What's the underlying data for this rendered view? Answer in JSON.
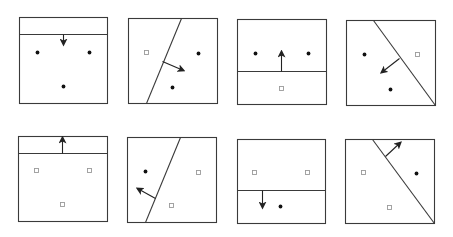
{
  "figure": {
    "width": 453,
    "height": 237,
    "colors": {
      "frame": "#3a3a3a",
      "line": "#3a3a3a",
      "arrow": "#222222",
      "dot": "#111111",
      "square_stroke": "#9a9a9a",
      "background": "#ffffff"
    },
    "panels": [
      {
        "id": "top-1",
        "box": [
          19,
          17,
          107,
          103
        ],
        "boundary": [
          [
            19,
            34
          ],
          [
            107,
            34
          ]
        ],
        "arrow": [
          [
            63,
            34
          ],
          [
            63,
            44
          ]
        ],
        "dots": [
          [
            37,
            52
          ],
          [
            89,
            52
          ],
          [
            63,
            86
          ]
        ],
        "squares": []
      },
      {
        "id": "top-2",
        "box": [
          128,
          18,
          217,
          103
        ],
        "boundary": [
          [
            181,
            18
          ],
          [
            146,
            103
          ]
        ],
        "arrow": [
          [
            162,
            61
          ],
          [
            183,
            70
          ]
        ],
        "dots": [
          [
            198,
            53
          ],
          [
            172,
            87
          ]
        ],
        "squares": [
          [
            146,
            52
          ]
        ]
      },
      {
        "id": "top-3",
        "box": [
          237,
          19,
          326,
          104
        ],
        "boundary": [
          [
            237,
            71
          ],
          [
            326,
            71
          ]
        ],
        "arrow": [
          [
            281,
            71
          ],
          [
            281,
            51
          ]
        ],
        "dots": [
          [
            255,
            53
          ],
          [
            308,
            53
          ]
        ],
        "squares": [
          [
            281,
            88
          ]
        ]
      },
      {
        "id": "top-4",
        "box": [
          346,
          20,
          435,
          105
        ],
        "boundary": [
          [
            373,
            20
          ],
          [
            435,
            105
          ]
        ],
        "arrow": [
          [
            399,
            58
          ],
          [
            381,
            72
          ]
        ],
        "dots": [
          [
            364,
            54
          ],
          [
            390,
            89
          ]
        ],
        "squares": [
          [
            417,
            54
          ]
        ]
      },
      {
        "id": "bottom-1",
        "box": [
          18,
          136,
          107,
          221
        ],
        "boundary": [
          [
            18,
            153
          ],
          [
            107,
            153
          ]
        ],
        "arrow": [
          [
            62,
            153
          ],
          [
            62,
            137
          ]
        ],
        "dots": [],
        "squares": [
          [
            36,
            170
          ],
          [
            89,
            170
          ],
          [
            62,
            204
          ]
        ]
      },
      {
        "id": "bottom-2",
        "box": [
          127,
          137,
          216,
          222
        ],
        "boundary": [
          [
            180,
            137
          ],
          [
            145,
            222
          ]
        ],
        "arrow": [
          [
            155,
            198
          ],
          [
            137,
            188
          ]
        ],
        "dots": [
          [
            145,
            171
          ]
        ],
        "squares": [
          [
            198,
            172
          ],
          [
            171,
            205
          ]
        ]
      },
      {
        "id": "bottom-3",
        "box": [
          237,
          139,
          325,
          223
        ],
        "boundary": [
          [
            237,
            190
          ],
          [
            325,
            190
          ]
        ],
        "arrow": [
          [
            262,
            190
          ],
          [
            262,
            207
          ]
        ],
        "dots": [
          [
            280,
            206
          ]
        ],
        "squares": [
          [
            254,
            172
          ],
          [
            307,
            172
          ]
        ]
      },
      {
        "id": "bottom-4",
        "box": [
          345,
          139,
          434,
          223
        ],
        "boundary": [
          [
            372,
            139
          ],
          [
            434,
            223
          ]
        ],
        "arrow": [
          [
            385,
            156
          ],
          [
            400,
            142
          ]
        ],
        "dots": [
          [
            416,
            173
          ]
        ],
        "squares": [
          [
            363,
            172
          ],
          [
            389,
            207
          ]
        ]
      }
    ]
  }
}
